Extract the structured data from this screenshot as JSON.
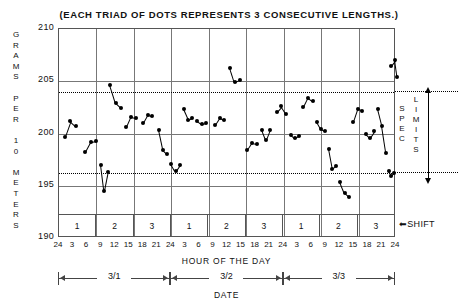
{
  "chart_data": {
    "type": "scatter",
    "title": "(EACH TRIAD OF DOTS REPRESENTS 3 CONSECUTIVE LENGTHS.)",
    "ylabel": "GRAMS PER 10 METERS",
    "xlabel": "HOUR OF THE DAY",
    "xlabel2": "DATE",
    "ylim": [
      190,
      210
    ],
    "yticks": [
      210,
      205,
      200,
      195,
      190
    ],
    "grid": true,
    "legend": "none",
    "spec_limits": {
      "upper": 204.0,
      "lower": 196.2,
      "label_left": "SPEC",
      "label_right": "LIMITS",
      "line_style": "dotted"
    },
    "shift_row_label": "SHIFT",
    "shifts": [
      "1",
      "2",
      "3",
      "1",
      "2",
      "3",
      "1",
      "2",
      "3"
    ],
    "dates": [
      "3/1",
      "3/2",
      "3/3"
    ],
    "xtick_labels": [
      "24",
      "3",
      "6",
      "9",
      "12",
      "15",
      "18",
      "21",
      "24",
      "3",
      "6",
      "9",
      "12",
      "15",
      "18",
      "21",
      "24",
      "3",
      "6",
      "9",
      "12",
      "15",
      "18",
      "21",
      "24"
    ],
    "xtick_hours": [
      24,
      3,
      6,
      9,
      12,
      15,
      18,
      21,
      24,
      3,
      6,
      9,
      12,
      15,
      18,
      21,
      24,
      3,
      6,
      9,
      12,
      15,
      18,
      21,
      24
    ],
    "note": "Each triad of connected dots is one sample of 3 consecutive lengths; x is elapsed hours 0-72 over three days.",
    "triads": [
      {
        "day": "3/1",
        "shift": "1",
        "x": [
          1.2,
          2.4,
          3.6
        ],
        "y": [
          199.7,
          201.2,
          200.7
        ]
      },
      {
        "day": "3/1",
        "shift": "1",
        "x": [
          5.6,
          6.8,
          8.0
        ],
        "y": [
          198.2,
          199.2,
          199.3
        ]
      },
      {
        "day": "3/1",
        "shift": "1",
        "x": [
          8.9,
          9.6,
          10.4
        ],
        "y": [
          197.0,
          194.5,
          196.3
        ]
      },
      {
        "day": "3/1",
        "shift": "2",
        "x": [
          10.9,
          12.1,
          13.3
        ],
        "y": [
          204.6,
          202.9,
          202.4
        ]
      },
      {
        "day": "3/1",
        "shift": "2",
        "x": [
          14.4,
          15.4,
          16.4
        ],
        "y": [
          200.6,
          201.6,
          201.5
        ]
      },
      {
        "day": "3/1",
        "shift": "2",
        "x": [
          18.0,
          19.0,
          19.9
        ],
        "y": [
          201.0,
          201.8,
          201.7
        ]
      },
      {
        "day": "3/1",
        "shift": "3",
        "x": [
          21.3,
          22.2,
          23.1
        ],
        "y": [
          200.3,
          198.4,
          198.0
        ]
      },
      {
        "day": "3/1",
        "shift": "3",
        "x": [
          24.0,
          24.9,
          25.8
        ],
        "y": [
          197.1,
          196.4,
          197.0
        ]
      },
      {
        "day": "3/2",
        "shift": "1",
        "x": [
          26.6,
          27.6,
          28.5
        ],
        "y": [
          202.3,
          201.3,
          201.5
        ]
      },
      {
        "day": "3/2",
        "shift": "1",
        "x": [
          29.5,
          30.5,
          31.5
        ],
        "y": [
          201.2,
          200.9,
          201.0
        ]
      },
      {
        "day": "3/2",
        "shift": "1",
        "x": [
          33.3,
          34.3,
          35.3
        ],
        "y": [
          200.8,
          201.5,
          201.3
        ]
      },
      {
        "day": "3/2",
        "shift": "2",
        "x": [
          36.6,
          37.6,
          38.6
        ],
        "y": [
          206.3,
          204.9,
          205.1
        ]
      },
      {
        "day": "3/2",
        "shift": "2",
        "x": [
          40.2,
          41.2,
          42.2
        ],
        "y": [
          198.4,
          199.1,
          199.0
        ]
      },
      {
        "day": "3/2",
        "shift": "2",
        "x": [
          43.4,
          44.2,
          45.0
        ],
        "y": [
          200.3,
          199.4,
          200.3
        ]
      },
      {
        "day": "3/2",
        "shift": "3",
        "x": [
          46.5,
          47.5,
          48.5
        ],
        "y": [
          202.1,
          202.6,
          201.9
        ]
      },
      {
        "day": "3/2",
        "shift": "3",
        "x": [
          49.6,
          50.4,
          51.2
        ],
        "y": [
          199.9,
          199.6,
          199.8
        ]
      },
      {
        "day": "3/2",
        "shift": "3",
        "x": [
          52.2,
          53.2,
          54.2
        ],
        "y": [
          202.5,
          203.4,
          203.1
        ]
      },
      {
        "day": "3/3",
        "shift": "1",
        "x": [
          55.1,
          56.0,
          56.9
        ],
        "y": [
          201.1,
          200.4,
          200.2
        ]
      },
      {
        "day": "3/3",
        "shift": "1",
        "x": [
          57.6,
          58.4,
          59.2
        ],
        "y": [
          198.5,
          196.6,
          196.9
        ]
      },
      {
        "day": "3/3",
        "shift": "1",
        "x": [
          60.0,
          61.0,
          62.0
        ],
        "y": [
          195.4,
          194.3,
          193.9
        ]
      },
      {
        "day": "3/3",
        "shift": "2",
        "x": [
          62.9,
          63.8,
          64.7
        ],
        "y": [
          201.1,
          202.3,
          202.2
        ]
      },
      {
        "day": "3/3",
        "shift": "2",
        "x": [
          65.6,
          66.5,
          67.4
        ],
        "y": [
          200.0,
          199.6,
          200.2
        ]
      },
      {
        "day": "3/3",
        "shift": "3",
        "x": [
          68.1,
          69.0,
          69.9
        ],
        "y": [
          202.3,
          200.7,
          198.1
        ]
      },
      {
        "day": "3/3",
        "shift": "3",
        "x": [
          70.4,
          71.0,
          71.6
        ],
        "y": [
          196.4,
          195.9,
          196.2
        ]
      },
      {
        "day": "3/3",
        "shift": "3",
        "x": [
          70.9,
          71.8,
          72.3
        ],
        "y": [
          206.5,
          207.0,
          205.4
        ]
      }
    ]
  },
  "axis": {
    "y_letters": [
      "G",
      "R",
      "A",
      "M",
      "S",
      "",
      "P",
      "E",
      "R",
      "",
      "1",
      "0",
      "",
      "M",
      "E",
      "T",
      "E",
      "R",
      "S"
    ],
    "spec_left_letters": [
      "S",
      "P",
      "E",
      "C"
    ],
    "spec_right_letters": [
      "L",
      "I",
      "M",
      "I",
      "T",
      "S"
    ]
  },
  "colors": {
    "data": "#000000",
    "grid": "#777777",
    "frame": "#555555",
    "background": "#ffffff"
  }
}
